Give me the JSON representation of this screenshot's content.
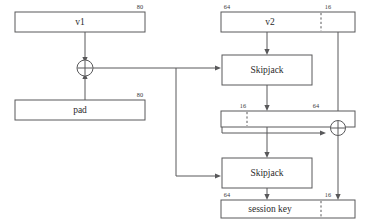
{
  "diagram": {
    "colors": {
      "stroke": "#58585a",
      "text": "#2b2b2b",
      "background": "#ffffff"
    },
    "boxes": {
      "v1": {
        "label": "v1",
        "bits": "80"
      },
      "pad": {
        "label": "pad",
        "bits": "80"
      },
      "v2": {
        "label": "v2",
        "bits_left": "64",
        "bits_right": "16"
      },
      "skipjack_top": {
        "label": "Skipjack"
      },
      "skipjack_bottom": {
        "label": "Skipjack"
      },
      "intermediate": {
        "label": "",
        "bits_left": "16",
        "bits_right": "64"
      },
      "session_key": {
        "label": "session key",
        "bits_left": "64",
        "bits_right": "16"
      }
    },
    "operators": {
      "xor_left": {
        "symbol": "+"
      },
      "xor_right": {
        "symbol": "+"
      }
    }
  }
}
